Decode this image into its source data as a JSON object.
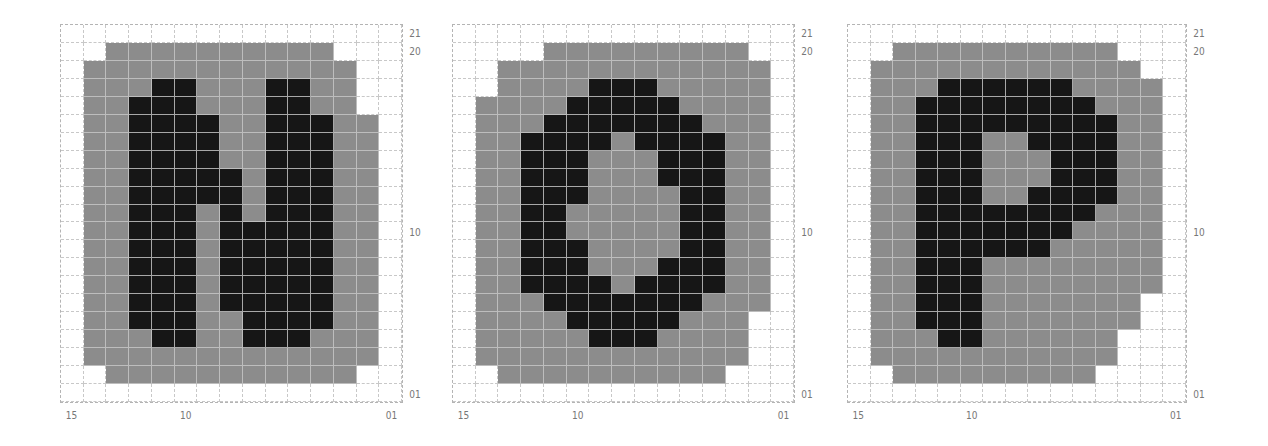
{
  "colors": {
    "white": "#ffffff",
    "gray": "#8c8c8c",
    "black": "#161616",
    "gridline": "#c8c8c8",
    "label": "#777777"
  },
  "legend_codes": {
    "W": "empty",
    "G": "gray",
    "B": "black"
  },
  "panels": [
    {
      "letter": "N",
      "x": 60,
      "y": 24,
      "width": 343,
      "height": 379,
      "right_labels": [
        {
          "text": "21",
          "row": 0
        },
        {
          "text": "20",
          "row": 1
        },
        {
          "text": "10",
          "row": 11
        },
        {
          "text": "01",
          "row": 20
        }
      ],
      "bottom_labels": [
        {
          "text": "15",
          "col": 0
        },
        {
          "text": "10",
          "col": 5
        },
        {
          "text": "01",
          "col": 14
        }
      ],
      "rows": [
        "WWWWWWWWWWWWWWW",
        "WWGGGGGGGGGGWWW",
        "WGGGGGGGGGGGGWW",
        "WGGGBBGGGBBGGWW",
        "WGGBBBGGGBBGGWW",
        "WGGBBBBGGBBBGGW",
        "WGGBBBBGGBBBGGW",
        "WGGBBBBGGBBBGGW",
        "WGGBBBBBGBBBGGW",
        "WGGBBBBBGBBBGGW",
        "WGGBBBGBGBBBGGW",
        "WGGBBBGBBBBBGGW",
        "WGGBBBGBBBBBGGW",
        "WGGBBBGBBBBBGGW",
        "WGGBBBGBBBBBGGW",
        "WGGBBBGBBBBBGGW",
        "WGGBBBGGBBBBGGW",
        "WGGGBBGGBBBGGGW",
        "WGGGGGGGGGGGGGW",
        "WWGGGGGGGGGGGWW",
        "WWWWWWWWWWWWWWW"
      ]
    },
    {
      "letter": "O",
      "x": 452,
      "y": 24,
      "width": 343,
      "height": 379,
      "right_labels": [
        {
          "text": "21",
          "row": 0
        },
        {
          "text": "20",
          "row": 1
        },
        {
          "text": "10",
          "row": 11
        },
        {
          "text": "01",
          "row": 20
        }
      ],
      "bottom_labels": [
        {
          "text": "15",
          "col": 0
        },
        {
          "text": "10",
          "col": 5
        },
        {
          "text": "01",
          "col": 14
        }
      ],
      "rows": [
        "WWWWWWWWWWWWWWW",
        "WWWWGGGGGGGGGWW",
        "WWGGGGGGGGGGGGW",
        "WWGGGGBBBGGGGGW",
        "WGGGGBBBBBGGGGW",
        "WGGGBBBBBBBGGGW",
        "WGGBBBBGBBBBGGW",
        "WGGBBBGGGBBBGGW",
        "WGGBBBGGGBBBGGW",
        "WGGBBBGGGGBBGGW",
        "WGGBBGGGGGBBGGW",
        "WGGBBGGGGGBBGGW",
        "WGGBBBGGGGBBGGW",
        "WGGBBBGGGBBBGGW",
        "WGGBBBBGBBBBGGW",
        "WGGGBBBBBBBGGGW",
        "WGGGGBBBBBGGGWW",
        "WGGGGGBBBGGGGWW",
        "WGGGGGGGGGGGGWW",
        "WWGGGGGGGGGGWWW",
        "WWWWWWWWWWWWWWW"
      ]
    },
    {
      "letter": "P",
      "x": 847,
      "y": 24,
      "width": 340,
      "height": 379,
      "right_labels": [
        {
          "text": "21",
          "row": 0
        },
        {
          "text": "20",
          "row": 1
        },
        {
          "text": "10",
          "row": 11
        },
        {
          "text": "01",
          "row": 20
        }
      ],
      "bottom_labels": [
        {
          "text": "15",
          "col": 0
        },
        {
          "text": "10",
          "col": 5
        },
        {
          "text": "01",
          "col": 14
        }
      ],
      "rows": [
        "WWWWWWWWWWWWWWW",
        "WWGGGGGGGGGGWWW",
        "WGGGGGGGGGGGGWW",
        "WGGGBBBBBBGGGGW",
        "WGGBBBBBBBBGGGW",
        "WGGBBBBBBBBBGGW",
        "WGGBBBGGBBBBGGW",
        "WGGBBBGGGBBBGGW",
        "WGGBBBGGGBBBGGW",
        "WGGBBBGGBBBBGGW",
        "WGGBBBBBBBBGGGW",
        "WGGBBBBBBBGGGGW",
        "WGGBBBBBBGGGGGW",
        "WGGBBBGGGGGGGGW",
        "WGGBBBGGGGGGGGW",
        "WGGBBBGGGGGGGWW",
        "WGGBBBGGGGGGGWW",
        "WGGGBBGGGGGGWWW",
        "WGGGGGGGGGGGWWW",
        "WWGGGGGGGGGWWWW",
        "WWWWWWWWWWWWWWW"
      ]
    }
  ]
}
